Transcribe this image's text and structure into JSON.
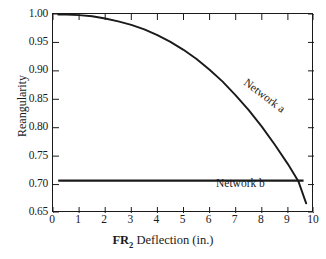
{
  "chart_data": {
    "type": "line",
    "title": "",
    "subtitle": "",
    "xlabel": "FR2 Deflection (in.)",
    "xlabel_prefix": "FR",
    "xlabel_subscript": "2",
    "xlabel_suffix": " Deflection (in.)",
    "ylabel": "Reangularity",
    "xlim": [
      0,
      10
    ],
    "ylim": [
      0.65,
      1.0
    ],
    "xticks": [
      0,
      1,
      2,
      3,
      4,
      5,
      6,
      7,
      8,
      9,
      10
    ],
    "yticks": [
      0.65,
      0.7,
      0.75,
      0.8,
      0.85,
      0.9,
      0.95,
      1.0
    ],
    "xtick_labels": [
      "0",
      "1",
      "2",
      "3",
      "4",
      "5",
      "6",
      "7",
      "8",
      "9",
      "10"
    ],
    "ytick_labels": [
      "0.65",
      "0.70",
      "0.75",
      "0.80",
      "0.85",
      "0.90",
      "0.95",
      "1.00"
    ],
    "grid": false,
    "legend": "inline-annotations",
    "ticks_direction": "inward",
    "frame": "full-box",
    "line_color": "#1a1a1a",
    "background_color": "#ffffff",
    "series": [
      {
        "name": "Network a",
        "label": "Network a",
        "label_rotation_deg": 37,
        "x": [
          0.2,
          0.5,
          1.0,
          1.5,
          2.0,
          2.5,
          3.0,
          3.5,
          4.0,
          4.5,
          5.0,
          5.5,
          6.0,
          6.5,
          7.0,
          7.5,
          8.0,
          8.5,
          9.0,
          9.4,
          9.7
        ],
        "values": [
          0.999,
          0.999,
          0.998,
          0.996,
          0.992,
          0.987,
          0.981,
          0.973,
          0.963,
          0.951,
          0.937,
          0.921,
          0.902,
          0.881,
          0.857,
          0.831,
          0.802,
          0.77,
          0.736,
          0.706,
          0.667
        ]
      },
      {
        "name": "Network b",
        "label": "Network b",
        "label_rotation_deg": 0,
        "x": [
          0.2,
          9.6
        ],
        "values": [
          0.707,
          0.707
        ]
      }
    ],
    "annotations": [
      {
        "text": "Network a",
        "x": 6.0,
        "y": 0.9
      },
      {
        "text": "Network b",
        "x": 4.4,
        "y": 0.725
      }
    ]
  }
}
